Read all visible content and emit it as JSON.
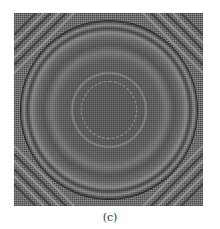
{
  "figure": {
    "panel_label": "(c)",
    "colors": {
      "background": "#6e6e6e",
      "dark_fringe": "#1a1a1a",
      "light_fringe": "#b8b8b8",
      "center": "#5a5a5a"
    }
  }
}
